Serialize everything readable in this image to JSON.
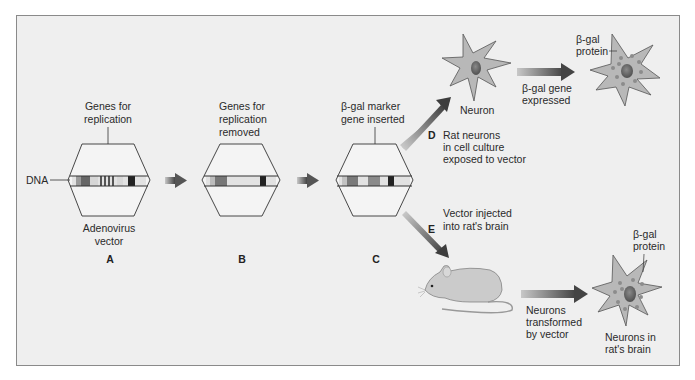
{
  "diagram": {
    "stages": [
      {
        "id": "A",
        "top_label": [
          "Genes for",
          "replication"
        ],
        "bottom_label": [
          "Adenovirus",
          "vector"
        ],
        "side_label": "DNA"
      },
      {
        "id": "B",
        "top_label": [
          "Genes for",
          "replication",
          "removed"
        ]
      },
      {
        "id": "C",
        "top_label": [
          "β-gal marker",
          "gene inserted"
        ]
      }
    ],
    "branch_d": {
      "letter": "D",
      "caption": [
        "Rat neurons",
        "in cell culture",
        "exposed to vector"
      ],
      "cell_label": "Neuron",
      "arrow_label": [
        "β-gal gene",
        "expressed"
      ],
      "result_label": [
        "β-gal",
        "protein"
      ]
    },
    "branch_e": {
      "letter": "E",
      "caption": [
        "Vector injected",
        "into rat's brain"
      ],
      "arrow_label": [
        "Neurons",
        "transformed",
        "by vector"
      ],
      "result_label": [
        "β-gal",
        "protein"
      ],
      "cell_caption": [
        "Neurons in",
        "rat's brain"
      ]
    },
    "colors": {
      "panel_bg": "#efefef",
      "border": "#8a8a8a",
      "cell_fill": "#b8b8b8",
      "nucleus": "#6f6f6f",
      "arrow_dark": "#4a4a4a",
      "arrow_light": "#bdbdbd"
    }
  }
}
